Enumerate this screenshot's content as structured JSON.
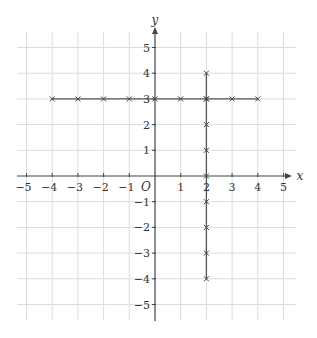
{
  "diagram": {
    "type": "coordinate-grid",
    "axes": {
      "x_label": "x",
      "y_label": "y",
      "origin_label": "O",
      "x_range": [
        -5,
        5
      ],
      "y_range": [
        -5,
        5
      ],
      "x_ticks": [
        "−5",
        "−4",
        "−3",
        "−2",
        "−1",
        "1",
        "2",
        "3",
        "4",
        "5"
      ],
      "y_ticks": [
        "5",
        "4",
        "3",
        "2",
        "1",
        "−1",
        "−2",
        "−3",
        "−4",
        "−5"
      ]
    },
    "lines": [
      {
        "name": "y = 3",
        "from": [
          -4,
          3
        ],
        "to": [
          4,
          3
        ]
      },
      {
        "name": "x = 2",
        "from": [
          2,
          4
        ],
        "to": [
          2,
          -4
        ]
      }
    ],
    "points_horizontal": [
      [
        -4,
        3
      ],
      [
        -3,
        3
      ],
      [
        -2,
        3
      ],
      [
        -1,
        3
      ],
      [
        0,
        3
      ],
      [
        1,
        3
      ],
      [
        2,
        3
      ],
      [
        3,
        3
      ],
      [
        4,
        3
      ]
    ],
    "points_vertical": [
      [
        2,
        4
      ],
      [
        2,
        3
      ],
      [
        2,
        2
      ],
      [
        2,
        1
      ],
      [
        2,
        0
      ],
      [
        2,
        -1
      ],
      [
        2,
        -2
      ],
      [
        2,
        -3
      ],
      [
        2,
        -4
      ]
    ],
    "colors": {
      "grid": "#dcdcdc",
      "axis": "#444444",
      "line": "#555555",
      "marker": "#444444"
    }
  }
}
